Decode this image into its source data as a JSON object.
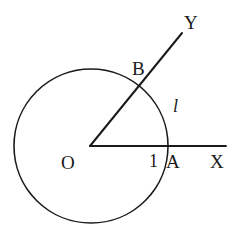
{
  "figure": {
    "type": "geometry-diagram",
    "background_color": "#ffffff",
    "stroke_color": "#1a1a1a",
    "text_color": "#1a1a1a"
  },
  "shapes": {
    "circle": {
      "name": "unit-circle",
      "center_x": 91,
      "center_y": 146,
      "radius": 77,
      "stroke_width": 1.6
    },
    "ray_ox": {
      "name": "ray-ox",
      "x1": 90,
      "y1": 146,
      "x2": 226,
      "y2": 146,
      "stroke_width": 1.8
    },
    "ray_oy": {
      "name": "ray-oy",
      "x1": 90,
      "y1": 146,
      "x2": 182,
      "y2": 33,
      "stroke_width": 2.0
    }
  },
  "labels": {
    "origin": {
      "text": "O",
      "x": 61,
      "y": 153
    },
    "unit": {
      "text": "1",
      "x": 149,
      "y": 152
    },
    "point_a": {
      "text": "A",
      "x": 166,
      "y": 152
    },
    "axis_x": {
      "text": "X",
      "x": 210,
      "y": 152
    },
    "point_b": {
      "text": "B",
      "x": 132,
      "y": 59
    },
    "axis_y": {
      "text": "Y",
      "x": 184,
      "y": 13
    },
    "arc_length": {
      "text": "l",
      "x": 173,
      "y": 97
    }
  }
}
